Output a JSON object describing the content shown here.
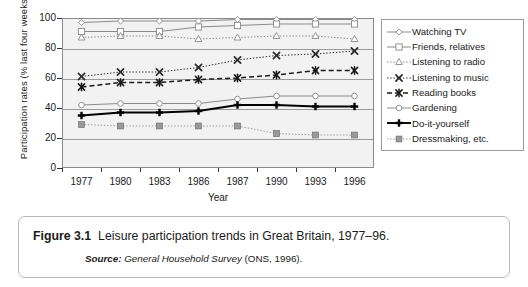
{
  "chart_data": {
    "type": "line",
    "title": "",
    "xlabel": "Year",
    "ylabel": "Participation rates (% last four weeks)",
    "categories": [
      "1977",
      "1980",
      "1983",
      "1986",
      "1987",
      "1990",
      "1993",
      "1996"
    ],
    "ylim": [
      0,
      100
    ],
    "yticks": [
      0,
      20,
      40,
      60,
      80,
      100
    ],
    "grid": true,
    "legend_position": "right",
    "series": [
      {
        "name": "Watching TV",
        "values": [
          97,
          98,
          98,
          98,
          99,
          99,
          99,
          99
        ],
        "marker": "diamond-open",
        "line": "solid",
        "color": "#8a8a8a"
      },
      {
        "name": "Friends, relatives",
        "values": [
          91,
          91,
          91,
          94,
          95,
          96,
          96,
          96
        ],
        "marker": "square-open",
        "line": "solid",
        "color": "#8a8a8a"
      },
      {
        "name": "Listening to radio",
        "values": [
          87,
          88,
          88,
          86,
          87,
          88,
          88,
          86
        ],
        "marker": "triangle-open",
        "line": "dotted",
        "color": "#8a8a8a"
      },
      {
        "name": "Listening to music",
        "values": [
          61,
          64,
          64,
          67,
          72,
          75,
          76,
          78
        ],
        "marker": "x-cross",
        "line": "dotted",
        "color": "#2a2a2a"
      },
      {
        "name": "Reading books",
        "values": [
          54,
          57,
          57,
          59,
          60,
          62,
          65,
          65
        ],
        "marker": "asterisk",
        "line": "dashed",
        "color": "#1a1a1a"
      },
      {
        "name": "Gardening",
        "values": [
          42,
          43,
          43,
          43,
          46,
          48,
          48,
          48
        ],
        "marker": "circle-open",
        "line": "solid",
        "color": "#8a8a8a"
      },
      {
        "name": "Do-it-yourself",
        "values": [
          35,
          37,
          37,
          38,
          42,
          42,
          41,
          41
        ],
        "marker": "plus-bold",
        "line": "solid",
        "color": "#000000"
      },
      {
        "name": "Dressmaking, etc.",
        "values": [
          29,
          28,
          28,
          28,
          28,
          23,
          22,
          22
        ],
        "marker": "square-filled",
        "line": "dotted",
        "color": "#9a9a9a"
      }
    ]
  },
  "caption": {
    "figure_number": "Figure 3.1",
    "title": "Leisure participation trends in Great Britain, 1977–96.",
    "source_label": "Source:",
    "source_name": "General Household Survey",
    "source_detail": "(ONS, 1996)."
  }
}
